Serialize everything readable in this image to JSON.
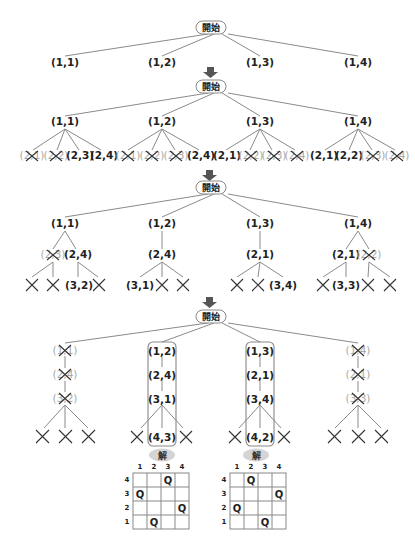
{
  "start_label": "開始",
  "solution_label": "解",
  "step1": {
    "children": [
      "(1,1)",
      "(1,2)",
      "(1,3)",
      "(1,4)"
    ]
  },
  "step2": {
    "level1": [
      "(1,1)",
      "(1,2)",
      "(1,3)",
      "(1,4)"
    ],
    "level2": [
      [
        {
          "t": "(2,1)",
          "x": true
        },
        {
          "t": "(2,2)",
          "x": true
        },
        {
          "t": "(2,3)",
          "x": false
        },
        {
          "t": "(2,4)",
          "x": false
        }
      ],
      [
        {
          "t": "(2,1)",
          "x": true
        },
        {
          "t": "(2,2)",
          "x": true
        },
        {
          "t": "(2,3)",
          "x": true
        },
        {
          "t": "(2,4)",
          "x": false
        }
      ],
      [
        {
          "t": "(2,1)",
          "x": false
        },
        {
          "t": "(2,2)",
          "x": true
        },
        {
          "t": "(2,3)",
          "x": true
        },
        {
          "t": "(2,4)",
          "x": true
        }
      ],
      [
        {
          "t": "(2,1)",
          "x": false
        },
        {
          "t": "(2,2)",
          "x": false
        },
        {
          "t": "(2,3)",
          "x": true
        },
        {
          "t": "(2,4)",
          "x": true
        }
      ]
    ]
  },
  "step3": {
    "level1": [
      "(1,1)",
      "(1,2)",
      "(1,3)",
      "(1,4)"
    ],
    "level2": [
      [
        {
          "t": "(2,3)",
          "x": true
        },
        {
          "t": "(2,4)",
          "x": false
        }
      ],
      [
        {
          "t": "(2,4)",
          "x": false
        }
      ],
      [
        {
          "t": "(2,1)",
          "x": false
        }
      ],
      [
        {
          "t": "(2,1)",
          "x": false
        },
        {
          "t": "(2,2)",
          "x": true
        }
      ]
    ],
    "level3": [
      [
        "×",
        "×",
        "(3,2)",
        "×"
      ],
      [
        "(3,1)",
        "×",
        "×"
      ],
      [
        "×",
        "×",
        "(3,4)"
      ],
      [
        "×",
        "(3,3)",
        "×",
        "×"
      ]
    ]
  },
  "step4": {
    "branches": [
      {
        "nodes": [
          {
            "t": "(1,1)",
            "x": true
          },
          {
            "t": "(2,4)",
            "x": true
          },
          {
            "t": "(3,2)",
            "x": true
          }
        ],
        "leaves": [
          "×",
          "×",
          "×"
        ],
        "solution": false
      },
      {
        "nodes": [
          {
            "t": "(1,2)",
            "x": false
          },
          {
            "t": "(2,4)",
            "x": false
          },
          {
            "t": "(3,1)",
            "x": false
          }
        ],
        "leaves": [
          "×",
          "(4,3)",
          "×"
        ],
        "solution": true
      },
      {
        "nodes": [
          {
            "t": "(1,3)",
            "x": false
          },
          {
            "t": "(2,1)",
            "x": false
          },
          {
            "t": "(3,4)",
            "x": false
          }
        ],
        "leaves": [
          "×",
          "(4,2)",
          "×"
        ],
        "solution": true
      },
      {
        "nodes": [
          {
            "t": "(1,4)",
            "x": true
          },
          {
            "t": "(2,1)",
            "x": true
          },
          {
            "t": "(3,3)",
            "x": true
          }
        ],
        "leaves": [
          "×",
          "×",
          "×"
        ],
        "solution": false
      }
    ]
  },
  "solutions": [
    {
      "col_labels": [
        "1",
        "2",
        "3",
        "4"
      ],
      "row_labels": [
        "4",
        "3",
        "2",
        "1"
      ],
      "queens": [
        {
          "row": "4",
          "col": "3"
        },
        {
          "row": "3",
          "col": "1"
        },
        {
          "row": "2",
          "col": "4"
        },
        {
          "row": "1",
          "col": "2"
        }
      ],
      "queen_glyph": "Q"
    },
    {
      "col_labels": [
        "1",
        "2",
        "3",
        "4"
      ],
      "row_labels": [
        "4",
        "3",
        "2",
        "1"
      ],
      "queens": [
        {
          "row": "4",
          "col": "2"
        },
        {
          "row": "3",
          "col": "4"
        },
        {
          "row": "2",
          "col": "1"
        },
        {
          "row": "1",
          "col": "3"
        }
      ],
      "queen_glyph": "Q"
    }
  ],
  "colors": {
    "edge": "#8a8a8a",
    "text": "#222222",
    "pruned_text": "#a8a8a8",
    "arrow": "#555555",
    "solution_badge": "#d4d4d4"
  }
}
